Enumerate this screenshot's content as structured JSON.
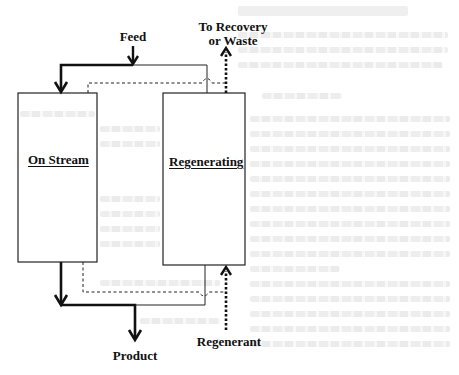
{
  "diagram": {
    "type": "process-flow",
    "labels": {
      "feed": "Feed",
      "recovery_line1": "To Recovery",
      "recovery_line2": "or Waste",
      "product": "Product",
      "regenerant": "Regenerant"
    },
    "units": [
      {
        "id": "on-stream",
        "title": "On Stream"
      },
      {
        "id": "regenerating",
        "title": "Regenerating"
      }
    ],
    "flows": [
      {
        "from": "Feed",
        "to": "On Stream",
        "style": "bold-solid"
      },
      {
        "from": "On Stream",
        "to": "Product",
        "style": "bold-solid"
      },
      {
        "from": "Regenerant",
        "to": "Regenerating",
        "style": "bold-dotted"
      },
      {
        "from": "Regenerating",
        "to": "To Recovery or Waste",
        "style": "bold-dotted"
      },
      {
        "from": "Feed line",
        "to": "Regenerating",
        "style": "thin-solid"
      },
      {
        "from": "On Stream",
        "to": "Recovery line",
        "style": "thin-dashed"
      }
    ],
    "colors": {
      "ink": "#111111",
      "background": "#ffffff",
      "bleed_through": "#e8e8e8"
    }
  }
}
